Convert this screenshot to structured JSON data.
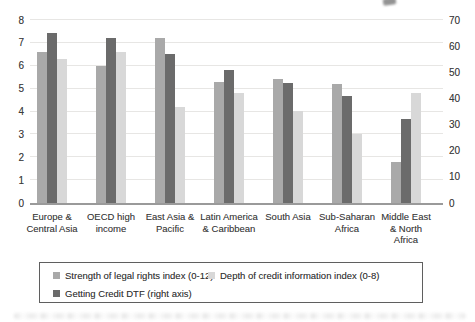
{
  "chart_data": {
    "type": "bar",
    "title": "",
    "xlabel": "",
    "ylabel_left": "",
    "ylabel_right": "",
    "categories": [
      "Europe & Central Asia",
      "OECD high income",
      "East Asia & Pacific",
      "Latin America & Caribbean",
      "South Asia",
      "Sub-Saharan Africa",
      "Middle East & North Africa"
    ],
    "category_lines": [
      [
        "Europe &",
        "Central Asia"
      ],
      [
        "OECD high",
        "income"
      ],
      [
        "East Asia &",
        "Pacific"
      ],
      [
        "Latin America",
        "& Caribbean"
      ],
      [
        "South Asia"
      ],
      [
        "Sub-Saharan",
        "Africa"
      ],
      [
        "Middle East",
        "& North",
        "Africa"
      ]
    ],
    "series": [
      {
        "name": "Strength of legal rights index (0-12)",
        "axis": "left",
        "color": "#a9a9a9",
        "values": [
          6.6,
          6.0,
          7.2,
          5.3,
          5.4,
          5.2,
          1.8
        ]
      },
      {
        "name": "Getting Credit DTF (right axis)",
        "axis": "right",
        "color": "#6b6b6b",
        "values": [
          65,
          63,
          57,
          51,
          46,
          41,
          32
        ]
      },
      {
        "name": "Depth of credit information index (0-8)",
        "axis": "left",
        "color": "#d8d8d8",
        "values": [
          6.3,
          6.6,
          4.2,
          4.8,
          4.0,
          3.0,
          4.8
        ]
      }
    ],
    "left_axis": {
      "min": 0,
      "max": 8,
      "tick_step": 1,
      "tick_labels": [
        "0",
        "1",
        "2",
        "3",
        "4",
        "5",
        "6",
        "7",
        "8"
      ]
    },
    "right_axis": {
      "min": 0,
      "max": 70,
      "tick_step": 10,
      "tick_labels": [
        "0",
        "10",
        "20",
        "30",
        "40",
        "50",
        "60",
        "70"
      ]
    },
    "grid": true,
    "legend_position": "bottom"
  },
  "legend": {
    "border_color": "#5f5f5f",
    "rows": [
      [
        {
          "label": "Strength of legal rights index (0-12)",
          "color": "#a9a9a9"
        },
        {
          "label": "Depth of credit information index (0-8)",
          "color": "#d8d8d8"
        }
      ],
      [
        {
          "label": "Getting Credit DTF (right axis)",
          "color": "#6b6b6b"
        }
      ]
    ]
  },
  "colors": {
    "background": "#ffffff",
    "gridline": "#e7e6e4",
    "baseline": "#9a9a9a",
    "text": "#3d3d3d"
  }
}
